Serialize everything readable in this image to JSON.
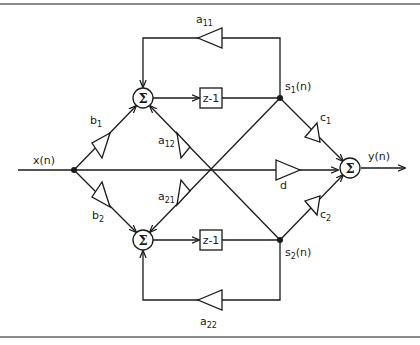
{
  "diagram": {
    "type": "signal-flow / state-space filter structure",
    "input": {
      "label": "x(n)"
    },
    "output": {
      "label": "y(n)"
    },
    "summers": [
      {
        "id": "sum1",
        "symbol": "Σ"
      },
      {
        "id": "sum2",
        "symbol": "Σ"
      },
      {
        "id": "sum_out",
        "symbol": "Σ"
      }
    ],
    "delays": [
      {
        "id": "delay1",
        "label": "z-1"
      },
      {
        "id": "delay2",
        "label": "z-1"
      }
    ],
    "states": [
      {
        "id": "s1",
        "base": "s",
        "sub": "1",
        "rest": "(n)"
      },
      {
        "id": "s2",
        "base": "s",
        "sub": "2",
        "rest": "(n)"
      }
    ],
    "gains": {
      "a11": {
        "base": "a",
        "sub": "11"
      },
      "a12": {
        "base": "a",
        "sub": "12"
      },
      "a21": {
        "base": "a",
        "sub": "21"
      },
      "a22": {
        "base": "a",
        "sub": "22"
      },
      "b1": {
        "base": "b",
        "sub": "1"
      },
      "b2": {
        "base": "b",
        "sub": "2"
      },
      "c1": {
        "base": "c",
        "sub": "1"
      },
      "c2": {
        "base": "c",
        "sub": "2"
      },
      "d": {
        "base": "d",
        "sub": ""
      }
    }
  }
}
